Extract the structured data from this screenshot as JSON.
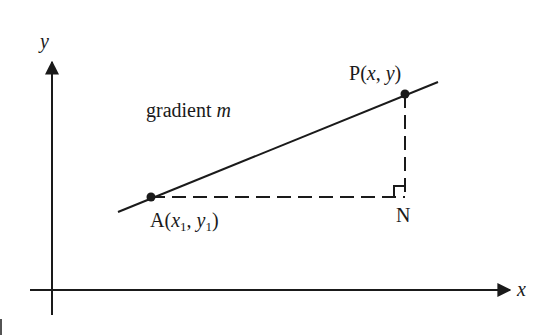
{
  "diagram": {
    "axes": {
      "x_label": "x",
      "y_label": "y"
    },
    "line": {
      "label_text": "gradient ",
      "label_var": "m"
    },
    "points": {
      "A": {
        "name": "A",
        "open": "(",
        "x": "x",
        "x_sub": "1",
        "sep": ", ",
        "y": "y",
        "y_sub": "1",
        "close": ")"
      },
      "P": {
        "name": "P",
        "open": "(",
        "x": "x",
        "sep": ", ",
        "y": "y",
        "close": ")"
      },
      "N": {
        "name": "N"
      }
    },
    "colors": {
      "ink": "#1a1a1a",
      "background": "#ffffff"
    }
  }
}
